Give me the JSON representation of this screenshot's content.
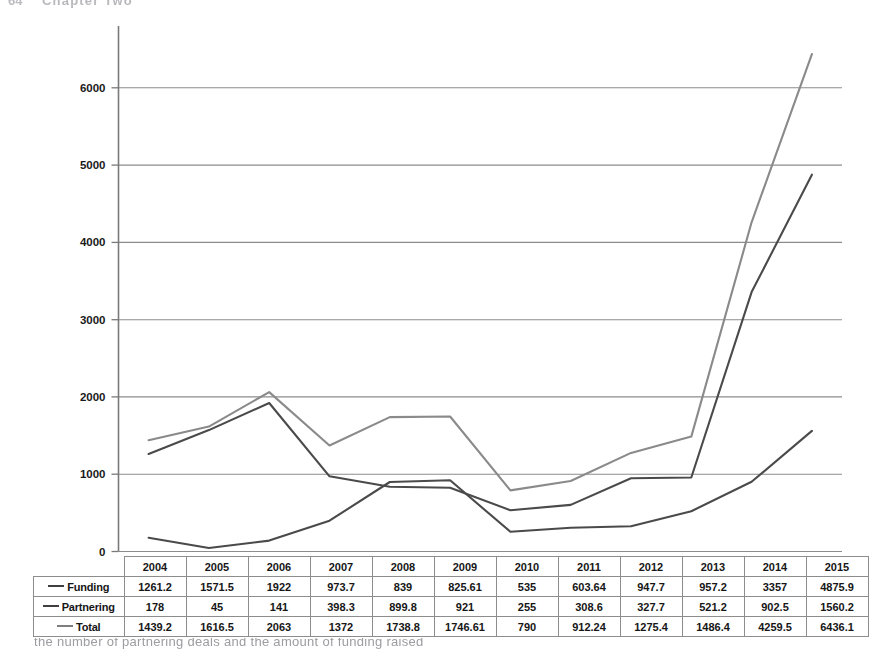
{
  "page": {
    "header_number": "64",
    "header_text": "Chapter Two",
    "bottom_caption": "the number of partnering deals and the amount of funding raised"
  },
  "chart_data": {
    "type": "line",
    "title": "",
    "xlabel": "",
    "ylabel": "",
    "categories": [
      "2004",
      "2005",
      "2006",
      "2007",
      "2008",
      "2009",
      "2010",
      "2011",
      "2012",
      "2013",
      "2014",
      "2015"
    ],
    "ylim": [
      0,
      6800
    ],
    "yticks": [
      "0",
      "1000",
      "2000",
      "3000",
      "4000",
      "5000",
      "6000"
    ],
    "ytick_values": [
      0,
      1000,
      2000,
      3000,
      4000,
      5000,
      6000
    ],
    "grid": true,
    "legend_position": "row-labels-in-table",
    "series": [
      {
        "name": "Funding",
        "color": "#4a4a4a",
        "values": [
          1261.2,
          1571.5,
          1922,
          973.7,
          839,
          825.61,
          535,
          603.64,
          947.7,
          957.2,
          3357,
          4875.9
        ],
        "labels": [
          "1261.2",
          "1571.5",
          "1922",
          "973.7",
          "839",
          "825.61",
          "535",
          "603.64",
          "947.7",
          "957.2",
          "3357",
          "4875.9"
        ]
      },
      {
        "name": "Partnering",
        "color": "#4a4a4a",
        "values": [
          178,
          45,
          141,
          398.3,
          899.8,
          921,
          255,
          308.6,
          327.7,
          521.2,
          902.5,
          1560.2
        ],
        "labels": [
          "178",
          "45",
          "141",
          "398.3",
          "899.8",
          "921",
          "255",
          "308.6",
          "327.7",
          "521.2",
          "902.5",
          "1560.2"
        ]
      },
      {
        "name": "Total",
        "color": "#8a8a8a",
        "values": [
          1439.2,
          1616.5,
          2063,
          1372,
          1738.8,
          1746.61,
          790,
          912.24,
          1275.4,
          1486.4,
          4259.5,
          6436.1
        ],
        "labels": [
          "1439.2",
          "1616.5",
          "2063",
          "1372",
          "1738.8",
          "1746.61",
          "790",
          "912.24",
          "1275.4",
          "1486.4",
          "4259.5",
          "6436.1"
        ]
      }
    ]
  },
  "table": {
    "corner_label": "",
    "columns": [
      "2004",
      "2005",
      "2006",
      "2007",
      "2008",
      "2009",
      "2010",
      "2011",
      "2012",
      "2013",
      "2014",
      "2015"
    ],
    "rows": [
      {
        "label": "Funding",
        "swatch": "dark",
        "values": [
          "1261.2",
          "1571.5",
          "1922",
          "973.7",
          "839",
          "825.61",
          "535",
          "603.64",
          "947.7",
          "957.2",
          "3357",
          "4875.9"
        ]
      },
      {
        "label": "Partnering",
        "swatch": "dark",
        "values": [
          "178",
          "45",
          "141",
          "398.3",
          "899.8",
          "921",
          "255",
          "308.6",
          "327.7",
          "521.2",
          "902.5",
          "1560.2"
        ]
      },
      {
        "label": "Total",
        "swatch": "mid",
        "values": [
          "1439.2",
          "1616.5",
          "2063",
          "1372",
          "1738.8",
          "1746.61",
          "790",
          "912.24",
          "1275.4",
          "1486.4",
          "4259.5",
          "6436.1"
        ]
      }
    ]
  },
  "colors": {
    "axis": "#7a7a7a",
    "grid": "#8c8c8c",
    "funding": "#4a4a4a",
    "partnering": "#4a4a4a",
    "total": "#8a8a8a",
    "table_border": "#8d8d8d"
  }
}
